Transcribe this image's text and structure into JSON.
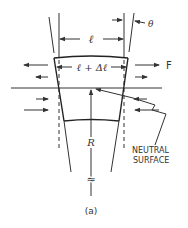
{
  "diagram": {
    "labels": {
      "length": "ℓ",
      "length_plus_delta": "ℓ + Δℓ",
      "force": "F",
      "angle": "θ",
      "radius": "R",
      "neutral_line1": "NEUTRAL",
      "neutral_line2": "SURFACE",
      "break_symbol": "≈",
      "caption": "(a)"
    },
    "colors": {
      "stroke": "#333333",
      "background": "#ffffff"
    }
  }
}
